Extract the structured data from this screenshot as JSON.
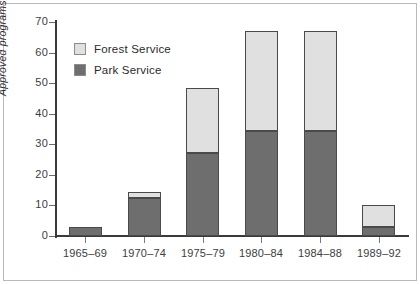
{
  "chart_data": {
    "type": "bar",
    "subtype": "stacked-vertical",
    "title": "",
    "xlabel": "",
    "ylabel": "Approved programs",
    "categories": [
      "1965–69",
      "1970–74",
      "1975–79",
      "1980–84",
      "1984–88",
      "1989–92"
    ],
    "series": [
      {
        "name": "Park Service",
        "color": "#6e6e6e",
        "values": [
          3,
          12.5,
          27,
          34.5,
          34.5,
          3
        ]
      },
      {
        "name": "Forest Service",
        "color": "#e0e0e0",
        "values": [
          0,
          2,
          21.5,
          32.5,
          32.5,
          7
        ]
      }
    ],
    "stack_order_bottom_to_top": [
      "Park Service",
      "Forest Service"
    ],
    "totals": [
      3,
      14.5,
      48.5,
      67,
      67,
      10
    ],
    "ylim": [
      0,
      70
    ],
    "yticks": [
      0,
      10,
      20,
      30,
      40,
      50,
      60,
      70
    ],
    "ytick_labels": [
      "0",
      "10",
      "20",
      "30",
      "40",
      "50",
      "60",
      "70"
    ],
    "grid": false,
    "legend_position": "top-left-inside",
    "legend_entries": [
      "Forest Service",
      "Park Service"
    ]
  },
  "legend": {
    "items": [
      {
        "label": "Forest Service",
        "color": "#e0e0e0"
      },
      {
        "label": "Park Service",
        "color": "#6e6e6e"
      }
    ]
  },
  "axes": {
    "y_title": "Approved programs",
    "y_tick_labels": [
      "70",
      "60",
      "50",
      "40",
      "30",
      "20",
      "10",
      "0"
    ],
    "x_tick_labels": [
      "1965–69",
      "1970–74",
      "1975–79",
      "1980–84",
      "1984–88",
      "1989–92"
    ]
  },
  "style": {
    "axis_color": "#3a3a3a",
    "frame_color": "#b9b9b9",
    "bar_edge_color": "#4a4a4a",
    "background": "#ffffff"
  }
}
